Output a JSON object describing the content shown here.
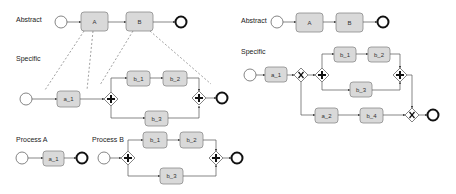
{
  "left": {
    "abstract": {
      "label": "Abstract",
      "tasks": [
        "A",
        "B"
      ]
    },
    "specific": {
      "label": "Specific",
      "tasks": [
        "a_1",
        "b_1",
        "b_2",
        "b_3"
      ]
    },
    "process_a": {
      "label": "Process A",
      "tasks": [
        "a_1"
      ]
    },
    "process_b": {
      "label": "Process B",
      "tasks": [
        "b_1",
        "b_2",
        "b_3"
      ]
    }
  },
  "right": {
    "abstract": {
      "label": "Abstract",
      "tasks": [
        "A",
        "B"
      ]
    },
    "specific": {
      "label": "Specific",
      "tasks": [
        "a_1",
        "b_1",
        "b_2",
        "b_3",
        "a_2",
        "b_4"
      ]
    }
  },
  "gateway_types": {
    "parallel": "+",
    "exclusive": "X"
  },
  "colors": {
    "task_fill": "#d9d9d9",
    "task_stroke": "#8a8a8a",
    "flow": "#555555",
    "end_event": "#111111"
  }
}
